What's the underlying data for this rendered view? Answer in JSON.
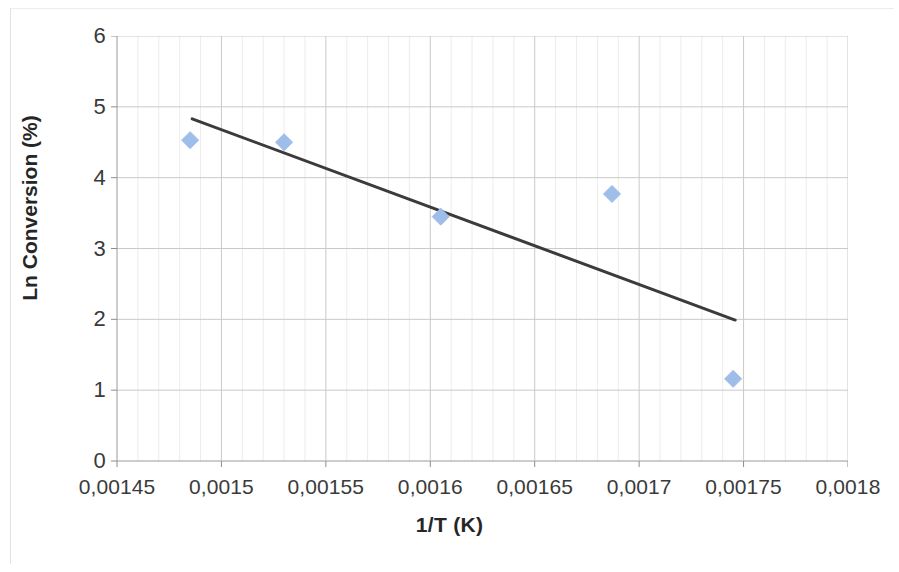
{
  "chart_data": {
    "type": "scatter",
    "title": "",
    "xlabel": "1/T (K)",
    "ylabel": "Ln Conversion (%)",
    "xlim": [
      0.00145,
      0.0018
    ],
    "ylim": [
      0,
      6
    ],
    "x_tick_labels": [
      "0,00145",
      "0,0015",
      "0,00155",
      "0,0016",
      "0,00165",
      "0,0017",
      "0,00175",
      "0,0018"
    ],
    "x_tick_values": [
      0.00145,
      0.0015,
      0.00155,
      0.0016,
      0.00165,
      0.0017,
      0.00175,
      0.0018
    ],
    "y_tick_labels": [
      "0",
      "1",
      "2",
      "3",
      "4",
      "5",
      "6"
    ],
    "y_tick_values": [
      0,
      1,
      2,
      3,
      4,
      5,
      6
    ],
    "grid": {
      "major_x": true,
      "major_y": true,
      "minor_x": true,
      "minor_y": false,
      "minor_x_divisions": 5,
      "major_color": "#c9c9c9",
      "minor_color": "#ececec"
    },
    "legend": null,
    "marker": {
      "shape": "diamond",
      "color": "#9FBDE9",
      "edge_color": "#9FBDE9",
      "size": 17
    },
    "series": [
      {
        "name": "Ln Conversion (%)",
        "points": [
          {
            "x": 0.001485,
            "y": 4.53
          },
          {
            "x": 0.00153,
            "y": 4.5
          },
          {
            "x": 0.001605,
            "y": 3.45
          },
          {
            "x": 0.001687,
            "y": 3.77
          },
          {
            "x": 0.001745,
            "y": 1.16
          }
        ]
      }
    ],
    "trendline": {
      "name": "Linear trendline",
      "color": "#3b3b3b",
      "width": 3,
      "start": {
        "x": 0.001486,
        "y": 4.83
      },
      "end": {
        "x": 0.001746,
        "y": 1.99
      }
    }
  }
}
